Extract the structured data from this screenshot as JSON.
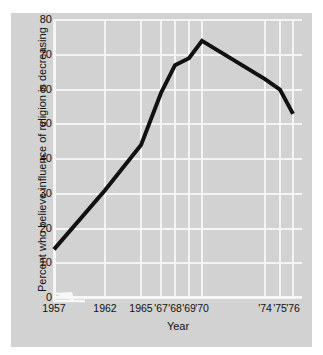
{
  "chart_data": {
    "type": "line",
    "title": "",
    "subtitle": "",
    "xlabel": "Year",
    "ylabel": "Percent who believe influence of religion is decreasing",
    "ylim": [
      0,
      80
    ],
    "ytick_values": [
      0,
      10,
      20,
      30,
      40,
      50,
      60,
      70,
      80
    ],
    "ytick_labels": [
      "0",
      "10",
      "20",
      "30",
      "40",
      "50",
      "60",
      "70",
      "80"
    ],
    "xtick_labels": [
      "1957",
      "1962",
      "1965",
      "'67",
      "'68",
      "'69",
      "'70",
      "'74",
      "'75",
      "'76"
    ],
    "x": [
      1957,
      1962,
      1965,
      1967,
      1968,
      1969,
      1970,
      1974,
      1975,
      1976
    ],
    "values": [
      14,
      31,
      44,
      59,
      67,
      69,
      74,
      63,
      60,
      53
    ],
    "series": [
      {
        "name": "Percent who believe influence of religion is decreasing",
        "values": [
          14,
          31,
          44,
          59,
          67,
          69,
          74,
          63,
          60,
          53
        ]
      }
    ],
    "grid": true,
    "grid_color": "#f4f4f4",
    "legend": false,
    "legend_position": "none",
    "line_color": "#111111",
    "panel_color": "#d2d2d2",
    "axis_break": true,
    "annotations": []
  },
  "axes": {
    "y_ticks": [
      {
        "label": "80",
        "value": 80
      },
      {
        "label": "70",
        "value": 70
      },
      {
        "label": "60",
        "value": 60
      },
      {
        "label": "50",
        "value": 50
      },
      {
        "label": "40",
        "value": 40
      },
      {
        "label": "30",
        "value": 30
      },
      {
        "label": "20",
        "value": 20
      },
      {
        "label": "10",
        "value": 10
      },
      {
        "label": "0",
        "value": 0
      }
    ],
    "x_ticks": [
      {
        "label": "1957",
        "value": 1957
      },
      {
        "label": "1962",
        "value": 1962
      },
      {
        "label": "1965",
        "value": 1965
      },
      {
        "label": "'67",
        "value": 1967
      },
      {
        "label": "'68",
        "value": 1968
      },
      {
        "label": "'69",
        "value": 1969
      },
      {
        "label": "'70",
        "value": 1970
      },
      {
        "label": "'74",
        "value": 1974
      },
      {
        "label": "'75",
        "value": 1975
      },
      {
        "label": "'76",
        "value": 1976
      }
    ]
  }
}
